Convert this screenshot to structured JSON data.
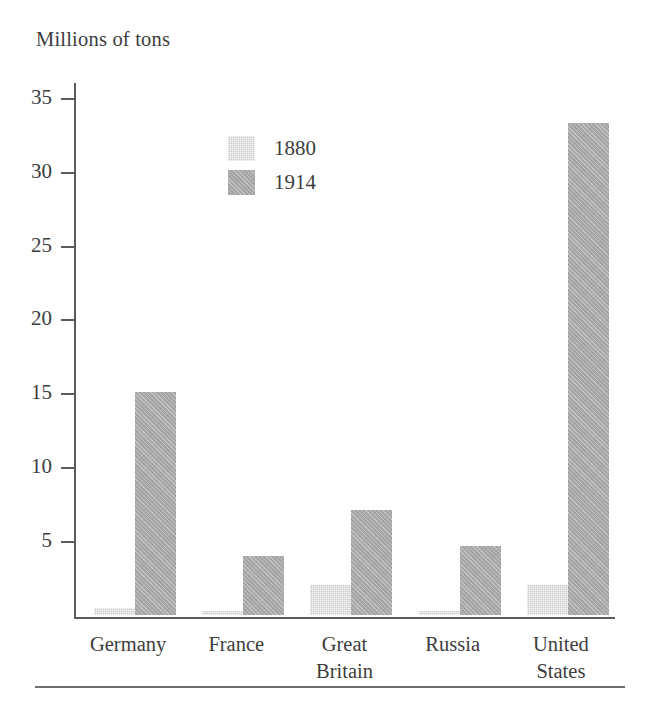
{
  "chart_data": {
    "type": "bar",
    "title": "Millions of tons",
    "xlabel": "",
    "ylabel": "Millions of tons",
    "categories": [
      "Germany",
      "France",
      "Great\nBritain",
      "Russia",
      "United\nStates"
    ],
    "series": [
      {
        "name": "1880",
        "color": "#c9c9c9",
        "values": [
          0.5,
          0.3,
          2.0,
          0.3,
          2.0
        ]
      },
      {
        "name": "1914",
        "color": "#a8a8a8",
        "values": [
          15.1,
          4.0,
          7.1,
          4.7,
          33.3
        ]
      }
    ],
    "ylim": [
      0,
      36
    ],
    "yticks": [
      5,
      10,
      15,
      20,
      25,
      30,
      35
    ],
    "ytick_labels": [
      "5",
      "10",
      "15",
      "20",
      "25",
      "30",
      "35"
    ],
    "grid": false,
    "legend_position": "inside-top-left"
  },
  "legend": {
    "entries": [
      {
        "label": "1880",
        "swatch_class": "s1880"
      },
      {
        "label": "1914",
        "swatch_class": "s1914"
      }
    ]
  },
  "footer": {
    "rule": ""
  }
}
